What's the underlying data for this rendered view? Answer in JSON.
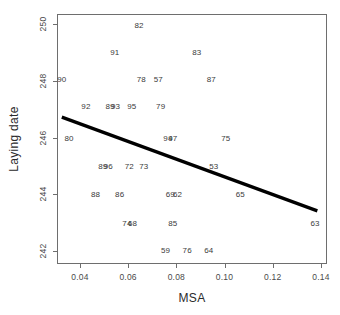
{
  "chart_data": {
    "type": "scatter",
    "title": "",
    "xlabel": "MSA",
    "ylabel": "Laying date",
    "xlim": [
      0.0305,
      0.1425
    ],
    "ylim": [
      241.55,
      250.35
    ],
    "grid": false,
    "legend": null,
    "point_render": "text-labels",
    "xticks": [
      "0.04",
      "0.06",
      "0.08",
      "0.10",
      "0.12",
      "0.14"
    ],
    "xtick_values": [
      0.04,
      0.06,
      0.08,
      0.1,
      0.12,
      0.14
    ],
    "yticks": [
      "242",
      "244",
      "246",
      "248",
      "250"
    ],
    "ytick_values": [
      242,
      244,
      246,
      248,
      250
    ],
    "points": [
      {
        "label": "82",
        "x": 0.0645,
        "y": 249.95
      },
      {
        "label": "91",
        "x": 0.0545,
        "y": 249.0
      },
      {
        "label": "83",
        "x": 0.0885,
        "y": 249.0
      },
      {
        "label": "90",
        "x": 0.0325,
        "y": 248.05
      },
      {
        "label": "78",
        "x": 0.0655,
        "y": 248.05
      },
      {
        "label": "57",
        "x": 0.0725,
        "y": 248.05
      },
      {
        "label": "87",
        "x": 0.0945,
        "y": 248.05
      },
      {
        "label": "92",
        "x": 0.0425,
        "y": 247.1
      },
      {
        "label": "89",
        "x": 0.0525,
        "y": 247.1
      },
      {
        "label": "93",
        "x": 0.0548,
        "y": 247.1
      },
      {
        "label": "95",
        "x": 0.0615,
        "y": 247.1
      },
      {
        "label": "79",
        "x": 0.0735,
        "y": 247.1
      },
      {
        "label": "80",
        "x": 0.0355,
        "y": 246.0
      },
      {
        "label": "94",
        "x": 0.0765,
        "y": 246.0
      },
      {
        "label": "97",
        "x": 0.0785,
        "y": 246.0
      },
      {
        "label": "75",
        "x": 0.1005,
        "y": 246.0
      },
      {
        "label": "89",
        "x": 0.0495,
        "y": 245.0
      },
      {
        "label": "96",
        "x": 0.0518,
        "y": 245.0
      },
      {
        "label": "72",
        "x": 0.0605,
        "y": 245.0
      },
      {
        "label": "73",
        "x": 0.0665,
        "y": 245.0
      },
      {
        "label": "53",
        "x": 0.0955,
        "y": 245.0
      },
      {
        "label": "88",
        "x": 0.0465,
        "y": 244.0
      },
      {
        "label": "86",
        "x": 0.0565,
        "y": 244.0
      },
      {
        "label": "69",
        "x": 0.0775,
        "y": 244.0
      },
      {
        "label": "62",
        "x": 0.0805,
        "y": 244.0
      },
      {
        "label": "65",
        "x": 0.1065,
        "y": 244.0
      },
      {
        "label": "74",
        "x": 0.0595,
        "y": 243.0
      },
      {
        "label": "68",
        "x": 0.0618,
        "y": 243.0
      },
      {
        "label": "85",
        "x": 0.0785,
        "y": 243.0
      },
      {
        "label": "63",
        "x": 0.1375,
        "y": 243.0
      },
      {
        "label": "59",
        "x": 0.0755,
        "y": 242.05
      },
      {
        "label": "76",
        "x": 0.0845,
        "y": 242.05
      },
      {
        "label": "64",
        "x": 0.0935,
        "y": 242.05
      }
    ],
    "trend_line": {
      "x_start": 0.0325,
      "y_start": 246.72,
      "x_end": 0.1385,
      "y_end": 243.42,
      "color": "#000000",
      "width_px": 3.2
    }
  }
}
